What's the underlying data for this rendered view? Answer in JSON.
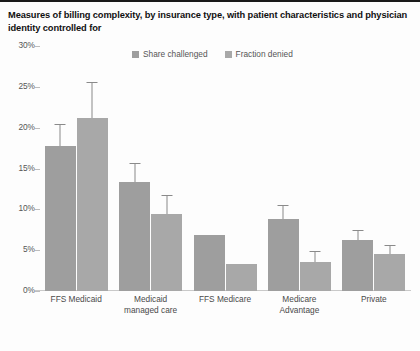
{
  "chart_data": {
    "type": "bar",
    "title": "Measures of billing complexity, by insurance type, with patient characteristics and physician identity controlled for",
    "xlabel": "",
    "ylabel": "",
    "ylim": [
      0,
      30
    ],
    "ytick_labels": [
      "30%",
      "25%",
      "20%",
      "15%",
      "10%",
      "5%",
      "0%"
    ],
    "ytick_values": [
      30,
      25,
      20,
      15,
      10,
      5,
      0
    ],
    "grid": false,
    "legend_position": "top-center",
    "categories": [
      "FFS Medicaid",
      "Medicaid managed care",
      "FFS Medicare",
      "Medicare Advantage",
      "Private"
    ],
    "category_lines": [
      [
        "FFS Medicaid"
      ],
      [
        "Medicaid",
        "managed care"
      ],
      [
        "FFS Medicare"
      ],
      [
        "Medicare",
        "Advantage"
      ],
      [
        "Private"
      ]
    ],
    "series": [
      {
        "name": "Share challenged",
        "color": "#9e9e9e",
        "values": [
          17.7,
          13.4,
          6.9,
          8.8,
          6.2
        ],
        "err_low": [
          15.0,
          11.4,
          null,
          7.3,
          5.1
        ],
        "err_high": [
          20.3,
          15.6,
          null,
          10.4,
          7.4
        ]
      },
      {
        "name": "Fraction denied",
        "color": "#a8a8a8",
        "values": [
          21.2,
          9.4,
          3.3,
          3.6,
          4.5
        ],
        "err_low": [
          17.2,
          7.5,
          null,
          2.6,
          3.6
        ],
        "err_high": [
          25.5,
          11.6,
          null,
          4.8,
          5.5
        ]
      }
    ]
  }
}
